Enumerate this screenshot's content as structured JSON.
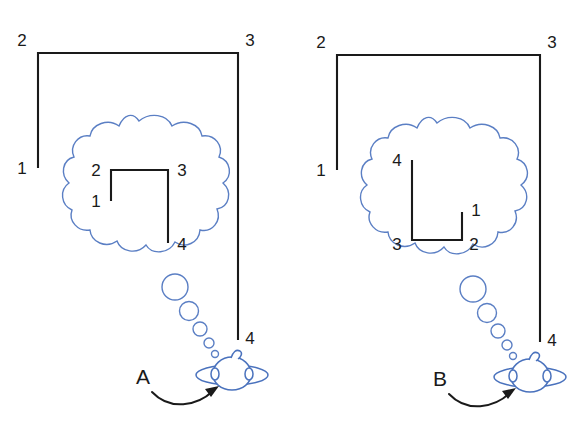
{
  "figure": {
    "background_color": "#ffffff",
    "outline_color": "#1a1a1a",
    "bubble_color": "#5b7fc4",
    "person_color": "#4a72bd"
  },
  "panels": [
    {
      "id": "panel-a",
      "letter": "A",
      "outer_shape": {
        "name": "outer-polyline-a",
        "description": "open rectangle-like polyline, tall right side",
        "vertex_labels": [
          "1",
          "2",
          "3",
          "4"
        ],
        "points": "38,168 38,53 238,53 238,340",
        "label_positions": [
          {
            "label": "1",
            "x": 22,
            "y": 170
          },
          {
            "label": "2",
            "x": 22,
            "y": 45
          },
          {
            "label": "3",
            "x": 244,
            "y": 45
          },
          {
            "label": "4",
            "x": 244,
            "y": 341
          }
        ]
      },
      "inner_shape": {
        "name": "inner-polyline-a",
        "description": "thought-bubble version of the shape, upright",
        "vertex_labels": [
          "1",
          "2",
          "3",
          "4"
        ],
        "points": "111,201 111,170 168,170 168,243",
        "label_positions": [
          {
            "label": "1",
            "x": 95,
            "y": 204
          },
          {
            "label": "2",
            "x": 95,
            "y": 176
          },
          {
            "label": "3",
            "x": 174,
            "y": 176
          },
          {
            "label": "4",
            "x": 174,
            "y": 247
          }
        ]
      },
      "cloud": {
        "cx": 139,
        "cy": 193,
        "rx": 77,
        "ry": 73
      },
      "tail_bubbles": [
        {
          "cx": 175,
          "cy": 287,
          "r": 13
        },
        {
          "cx": 189,
          "cy": 311,
          "r": 9.5
        },
        {
          "cx": 200,
          "cy": 329,
          "r": 7
        },
        {
          "cx": 209,
          "cy": 343,
          "r": 5
        },
        {
          "cx": 215,
          "cy": 354,
          "r": 3.5
        }
      ],
      "person": {
        "cx": 232,
        "cy": 374
      },
      "letter_position": {
        "x": 143,
        "y": 384
      },
      "arrow_path": "M152,392 C172,410 198,404 214,390",
      "arrow_tip": {
        "x": 218,
        "y": 386,
        "angle": -40
      }
    },
    {
      "id": "panel-b",
      "letter": "B",
      "outer_shape": {
        "name": "outer-polyline-b",
        "description": "open rectangle-like polyline, tall right side",
        "vertex_labels": [
          "1",
          "2",
          "3",
          "4"
        ],
        "points": "337,170 337,55 540,55 540,342"
      },
      "label_positions": [
        {
          "label": "1",
          "x": 320,
          "y": 172
        },
        {
          "label": "2",
          "x": 320,
          "y": 47
        },
        {
          "label": "3",
          "x": 546,
          "y": 47
        },
        {
          "label": "4",
          "x": 546,
          "y": 343
        }
      ],
      "inner_shape": {
        "name": "inner-polyline-b",
        "description": "thought-bubble version of the shape, rotated",
        "vertex_labels": [
          "1",
          "2",
          "3",
          "4"
        ],
        "points": "412,160 412,240 462,240 462,212",
        "label_positions": [
          {
            "label": "4",
            "x": 396,
            "y": 166
          },
          {
            "label": "3",
            "x": 396,
            "y": 247
          },
          {
            "label": "2",
            "x": 468,
            "y": 247
          },
          {
            "label": "1",
            "x": 468,
            "y": 214
          }
        ]
      },
      "cloud": {
        "cx": 437,
        "cy": 195,
        "rx": 77,
        "ry": 73
      },
      "tail_bubbles": [
        {
          "cx": 473,
          "cy": 289,
          "r": 13
        },
        {
          "cx": 487,
          "cy": 313,
          "r": 9.5
        },
        {
          "cx": 498,
          "cy": 331,
          "r": 7
        },
        {
          "cx": 507,
          "cy": 345,
          "r": 5
        },
        {
          "cx": 513,
          "cy": 356,
          "r": 3.5
        }
      ],
      "person": {
        "cx": 530,
        "cy": 376
      },
      "letter_position": {
        "x": 440,
        "y": 386
      },
      "arrow_path": "M449,394 C469,412 496,406 512,392",
      "arrow_tip": {
        "x": 516,
        "y": 388,
        "angle": -40
      }
    }
  ],
  "labels": {
    "panel_a_letter": "A",
    "panel_b_letter": "B",
    "n1": "1",
    "n2": "2",
    "n3": "3",
    "n4": "4"
  }
}
